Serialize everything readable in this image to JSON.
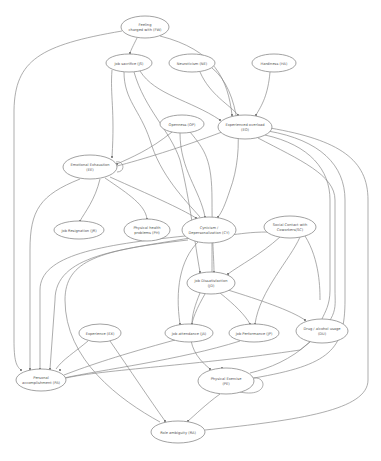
{
  "diagram": {
    "nodes": [
      {
        "id": "FW",
        "line1": "Feeling",
        "line2": "charged with (FW)",
        "cx": 145,
        "cy": 27,
        "rx": 24,
        "ry": 11
      },
      {
        "id": "JS",
        "line1": "Job sacrifice (JS)",
        "line2": "",
        "cx": 129,
        "cy": 63,
        "rx": 23,
        "ry": 9
      },
      {
        "id": "NE",
        "line1": "Neuroticism (NE)",
        "line2": "",
        "cx": 192,
        "cy": 63,
        "rx": 23,
        "ry": 9
      },
      {
        "id": "HA",
        "line1": "Hardiness (HA)",
        "line2": "",
        "cx": 274,
        "cy": 63,
        "rx": 22,
        "ry": 9
      },
      {
        "id": "OP",
        "line1": "Openness (OP)",
        "line2": "",
        "cx": 182,
        "cy": 124,
        "rx": 22,
        "ry": 9
      },
      {
        "id": "EO",
        "line1": "Experienced overload",
        "line2": "(EO)",
        "cx": 245,
        "cy": 127,
        "rx": 27,
        "ry": 12
      },
      {
        "id": "EE",
        "line1": "Emotional Exhaustion",
        "line2": "(EE)",
        "cx": 90,
        "cy": 167,
        "rx": 27,
        "ry": 12
      },
      {
        "id": "JR",
        "line1": "Job Resignation (JR)",
        "line2": "",
        "cx": 79,
        "cy": 230,
        "rx": 25,
        "ry": 9
      },
      {
        "id": "PH",
        "line1": "Physical health",
        "line2": "problems (PH)",
        "cx": 147,
        "cy": 230,
        "rx": 23,
        "ry": 11
      },
      {
        "id": "CY",
        "line1": "Cynicism /",
        "line2": "Depersonalization (CY)",
        "cx": 209,
        "cy": 230,
        "rx": 27,
        "ry": 13
      },
      {
        "id": "SC",
        "line1": "Social Contact with",
        "line2": "Coworkers(SC)",
        "cx": 290,
        "cy": 227,
        "rx": 26,
        "ry": 11
      },
      {
        "id": "JD",
        "line1": "Job Dissatisfaction",
        "line2": "(JD)",
        "cx": 211,
        "cy": 283,
        "rx": 24,
        "ry": 11
      },
      {
        "id": "JA",
        "line1": "Job attendance (JA)",
        "line2": "",
        "cx": 189,
        "cy": 333,
        "rx": 24,
        "ry": 9
      },
      {
        "id": "JP",
        "line1": "Job Performance (JP)",
        "line2": "",
        "cx": 254,
        "cy": 333,
        "rx": 25,
        "ry": 9
      },
      {
        "id": "DU",
        "line1": "Drug / alcohol usage",
        "line2": "(DU)",
        "cx": 322,
        "cy": 331,
        "rx": 26,
        "ry": 12
      },
      {
        "id": "EX",
        "line1": "Experience (EX)",
        "line2": "",
        "cx": 100,
        "cy": 333,
        "rx": 21,
        "ry": 9
      },
      {
        "id": "PA",
        "line1": "Personal",
        "line2": "accomplishment (PA)",
        "cx": 41,
        "cy": 380,
        "rx": 25,
        "ry": 11
      },
      {
        "id": "PE",
        "line1": "Physical Exercise",
        "line2": "(PE)",
        "cx": 226,
        "cy": 381,
        "rx": 28,
        "ry": 13
      },
      {
        "id": "RA",
        "line1": "Role ambiguity (RA)",
        "line2": "",
        "cx": 178,
        "cy": 432,
        "rx": 27,
        "ry": 11
      }
    ]
  }
}
